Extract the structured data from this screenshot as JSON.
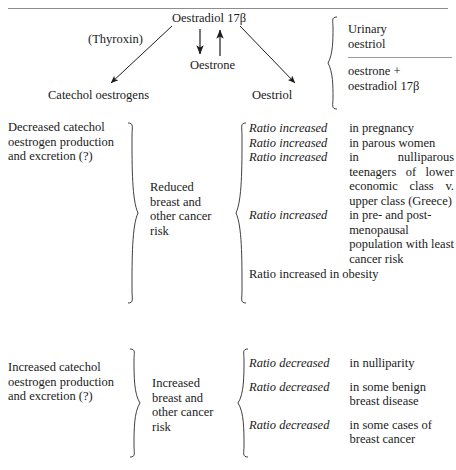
{
  "figure": {
    "pathway": {
      "oestradiol": "Oestradiol 17β",
      "thyroxin": "(Thyroxin)",
      "oestrone": "Oestrone",
      "catechol_oestrogens": "Catechol oestrogens",
      "oestriol": "Oestriol"
    },
    "ratio_fraction": {
      "numerator": "Urinary\noestriol",
      "numerator_line1": "Urinary",
      "numerator_line2": "oestriol",
      "denominator_line1": "oestrone +",
      "denominator_line2": "oestradiol 17β"
    },
    "sections": [
      {
        "cause": "Decreased catechol oestrogen production and excretion (?)",
        "outcome": "Reduced breast and other cancer risk",
        "rows": [
          {
            "label": "Ratio increased",
            "desc": "in pregnancy",
            "justify": false
          },
          {
            "label": "Ratio increased",
            "desc": "in parous women",
            "justify": false
          },
          {
            "label": "Ratio increased",
            "desc": "in nulliparous teenagers of lower economic class v. upper class (Greece)",
            "justify": true
          },
          {
            "label": "Ratio increased",
            "desc": "in pre- and post-menopausal population with least cancer risk",
            "justify": false
          }
        ],
        "plain_row": "Ratio increased in obesity"
      },
      {
        "cause": "Increased catechol oestrogen production and excretion (?)",
        "outcome": "Increased breast and other cancer risk",
        "rows": [
          {
            "label": "Ratio decreased",
            "desc": "in nulliparity",
            "justify": false
          },
          {
            "label": "Ratio decreased",
            "desc": "in some benign breast disease",
            "justify": false
          },
          {
            "label": "Ratio decreased",
            "desc": "in some cases of breast cancer",
            "justify": false
          }
        ],
        "plain_row": ""
      }
    ],
    "colors": {
      "text": "#1a1a1a",
      "rule": "#8d8d8d",
      "background": "#ffffff"
    }
  }
}
